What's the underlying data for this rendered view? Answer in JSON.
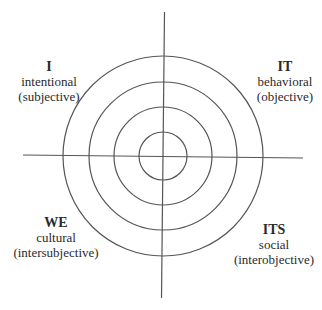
{
  "diagram": {
    "type": "four-quadrant concentric circles",
    "center": [
      163,
      156
    ],
    "radii": [
      24,
      49,
      74,
      100
    ],
    "stroke_color": "#555555",
    "quadrants": {
      "upper_left": {
        "title": "I",
        "line1": "intentional",
        "line2": "(subjective)"
      },
      "upper_right": {
        "title": "IT",
        "line1": "behavioral",
        "line2": "(objective)"
      },
      "lower_left": {
        "title": "WE",
        "line1": "cultural",
        "line2": "(intersubjective)"
      },
      "lower_right": {
        "title": "ITS",
        "line1": "social",
        "line2": "(interobjective)"
      }
    }
  }
}
